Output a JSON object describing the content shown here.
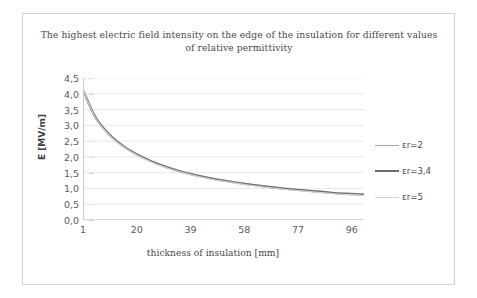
{
  "chart_data": {
    "type": "line",
    "title": "The highest electric field intensity on the edge of the insulation for different values of relative permittivity",
    "xlabel": "thickness of insulation [mm]",
    "ylabel": "E [MV/m]",
    "xlim": [
      1,
      100
    ],
    "ylim": [
      0,
      4.5
    ],
    "grid": true,
    "legend_position": "right",
    "xticks": [
      "1",
      "20",
      "39",
      "58",
      "77",
      "96"
    ],
    "xtick_values": [
      1,
      20,
      39,
      58,
      77,
      96
    ],
    "yticks": [
      "0,0",
      "0,5",
      "1,0",
      "1,5",
      "2,0",
      "2,5",
      "3,0",
      "3,5",
      "4,0",
      "4,5"
    ],
    "ytick_values": [
      0.0,
      0.5,
      1.0,
      1.5,
      2.0,
      2.5,
      3.0,
      3.5,
      4.0,
      4.5
    ],
    "x": [
      1,
      5,
      10,
      15,
      20,
      25,
      30,
      35,
      39,
      45,
      50,
      58,
      65,
      72,
      77,
      85,
      90,
      96,
      100
    ],
    "series": [
      {
        "name": "εr=2",
        "color": "#a6a6a6",
        "width": 1.3,
        "values": [
          4.05,
          3.28,
          2.72,
          2.35,
          2.08,
          1.87,
          1.7,
          1.56,
          1.47,
          1.35,
          1.27,
          1.16,
          1.08,
          1.01,
          0.97,
          0.91,
          0.87,
          0.84,
          0.82
        ]
      },
      {
        "name": "εr=3,4",
        "color": "#6b6b6b",
        "width": 2.1,
        "values": [
          4.05,
          3.26,
          2.7,
          2.33,
          2.06,
          1.85,
          1.68,
          1.54,
          1.45,
          1.33,
          1.25,
          1.14,
          1.06,
          0.99,
          0.95,
          0.89,
          0.85,
          0.82,
          0.8
        ]
      },
      {
        "name": "εr=5",
        "color": "#d0d0d0",
        "width": 1.3,
        "values": [
          4.05,
          3.24,
          2.68,
          2.31,
          2.04,
          1.83,
          1.66,
          1.52,
          1.43,
          1.31,
          1.23,
          1.12,
          1.04,
          0.97,
          0.93,
          0.87,
          0.83,
          0.8,
          0.78
        ]
      }
    ]
  },
  "colors": {
    "frame_border": "#d2d2d2",
    "gridline": "#e8e8e8",
    "axis_line": "#c9c9c9",
    "title_text": "#4a4a4a",
    "tick_text": "#5b5b5b"
  }
}
